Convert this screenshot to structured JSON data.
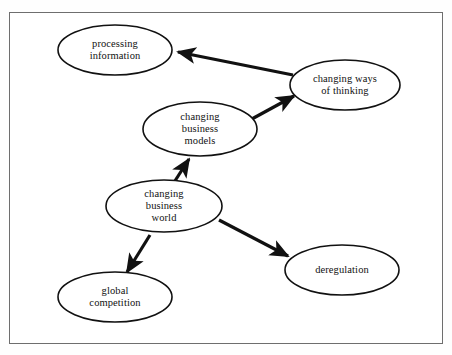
{
  "diagram": {
    "style": {
      "background": "#ffffff",
      "frame_border": "#6e6e6e",
      "ellipse_stroke": "#111111",
      "ellipse_fill": "#ffffff",
      "arrow_color": "#111111",
      "text_color": "#111111"
    },
    "nodes": [
      {
        "id": "processing-information",
        "label": "processing\ninformation",
        "cx": 115,
        "cy": 50,
        "rx": 57,
        "ry": 25
      },
      {
        "id": "changing-ways-of-thinking",
        "label": "changing ways\nof thinking",
        "cx": 345,
        "cy": 85,
        "rx": 55,
        "ry": 25
      },
      {
        "id": "changing-business-models",
        "label": "changing\nbusiness\nmodels",
        "cx": 200,
        "cy": 129,
        "rx": 57,
        "ry": 27
      },
      {
        "id": "changing-business-world",
        "label": "changing\nbusiness\nworld",
        "cx": 164,
        "cy": 206,
        "rx": 58,
        "ry": 26
      },
      {
        "id": "global-competition",
        "label": "global\ncompetition",
        "cx": 115,
        "cy": 297,
        "rx": 57,
        "ry": 25
      },
      {
        "id": "deregulation",
        "label": "deregulation",
        "cx": 342,
        "cy": 270,
        "rx": 57,
        "ry": 25
      }
    ],
    "edges": [
      {
        "id": "thinking-to-processing",
        "from": "changing-ways-of-thinking",
        "to": "processing-information",
        "x1": 293,
        "y1": 75,
        "x2": 178,
        "y2": 52
      },
      {
        "id": "models-to-thinking",
        "from": "changing-business-models",
        "to": "changing-ways-of-thinking",
        "x1": 250,
        "y1": 120,
        "x2": 294,
        "y2": 96
      },
      {
        "id": "world-to-models",
        "from": "changing-business-world",
        "to": "changing-business-models",
        "x1": 173,
        "y1": 184,
        "x2": 189,
        "y2": 159
      },
      {
        "id": "world-to-deregulation",
        "from": "changing-business-world",
        "to": "deregulation",
        "x1": 219,
        "y1": 220,
        "x2": 288,
        "y2": 256
      },
      {
        "id": "world-to-global-competition",
        "from": "changing-business-world",
        "to": "global-competition",
        "x1": 150,
        "y1": 235,
        "x2": 127,
        "y2": 272
      }
    ]
  }
}
